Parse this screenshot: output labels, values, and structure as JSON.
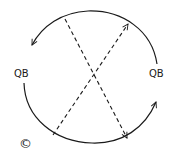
{
  "diagram": {
    "type": "circular exchange diagram",
    "labels": {
      "left": "QB",
      "right": "QB",
      "corner_symbol": "©"
    },
    "elements": [
      {
        "kind": "arc",
        "name": "top-arc",
        "direction": "counter-clockwise",
        "from": "right QB",
        "to": "left QB",
        "arrowhead": "left end"
      },
      {
        "kind": "arc",
        "name": "bottom-arc",
        "direction": "counter-clockwise",
        "from": "left QB",
        "to": "right QB",
        "arrowhead": "right end"
      },
      {
        "kind": "dashed-line",
        "name": "diagonal-down",
        "from": "upper-left",
        "to": "lower-right",
        "arrowhead": "lower-right"
      },
      {
        "kind": "dashed-line",
        "name": "diagonal-up",
        "from": "lower-left",
        "to": "upper-right",
        "arrowhead": "upper-right"
      }
    ],
    "colors": {
      "stroke": "#1a1a1a",
      "background": "#ffffff"
    }
  }
}
